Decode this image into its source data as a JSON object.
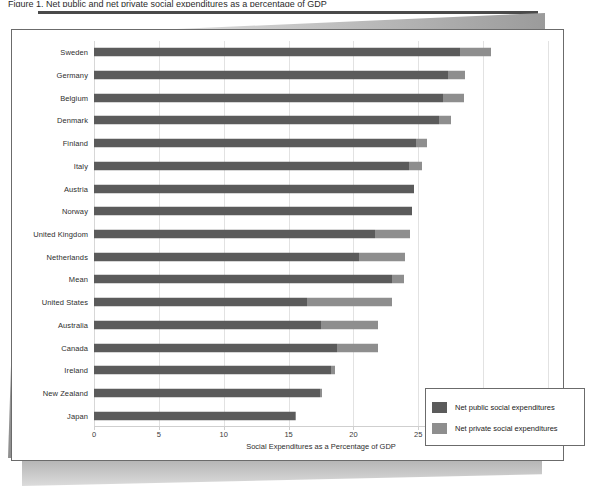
{
  "figure": {
    "caption_fragment": "Figure 1.  Net public and net private social expenditures as a percentage of GDP",
    "axis_label": "Social Expenditures as a Percentage of GDP"
  },
  "legend": {
    "position": "inside-bottom-right",
    "items": [
      {
        "label": "Net public social expenditures",
        "color": "#5b5b5b",
        "name": "net-public"
      },
      {
        "label": "Net private social expenditures",
        "color": "#8e8e8e",
        "name": "net-private"
      }
    ]
  },
  "chart_data": {
    "type": "bar",
    "orientation": "horizontal",
    "stacked": true,
    "title": "",
    "xlabel": "Social Expenditures as a Percentage of GDP",
    "ylabel": "",
    "xlim": [
      0,
      35
    ],
    "xticks": [
      0,
      5,
      10,
      15,
      20,
      25,
      30,
      35
    ],
    "grid": true,
    "categories": [
      "Sweden",
      "Germany",
      "Belgium",
      "Denmark",
      "Finland",
      "Italy",
      "Austria",
      "Norway",
      "United Kingdom",
      "Netherlands",
      "Mean",
      "United States",
      "Australia",
      "Canada",
      "Ireland",
      "New Zealand",
      "Japan"
    ],
    "series": [
      {
        "name": "Net public social expenditures",
        "color": "#5b5b5b",
        "values": [
          28.2,
          27.3,
          26.9,
          26.6,
          24.8,
          24.3,
          24.7,
          24.5,
          21.7,
          20.4,
          23.0,
          16.4,
          17.5,
          18.7,
          18.3,
          17.4,
          15.5
        ]
      },
      {
        "name": "Net private social expenditures",
        "color": "#8e8e8e",
        "values": [
          2.4,
          1.3,
          1.6,
          0.9,
          0.9,
          1.0,
          0.0,
          0.0,
          2.7,
          3.6,
          0.9,
          6.6,
          4.4,
          3.2,
          0.3,
          0.2,
          0.1
        ]
      }
    ],
    "totals": [
      30.6,
      28.6,
      28.5,
      27.5,
      25.7,
      25.3,
      24.7,
      24.5,
      24.4,
      24.0,
      23.9,
      23.0,
      21.9,
      21.9,
      18.6,
      17.6,
      15.6
    ]
  }
}
